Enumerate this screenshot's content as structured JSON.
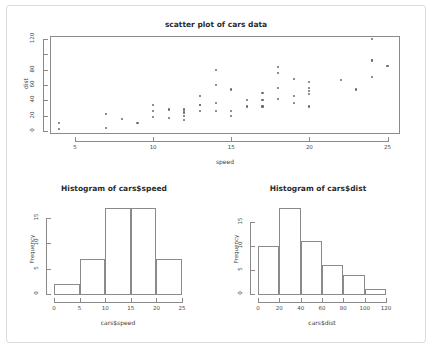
{
  "figure": {
    "background_color": "#ffffff",
    "frame_color": "#dcdcdc",
    "axis_color": "#8a8a8a",
    "point_color": "#6a6a6a"
  },
  "chart_data": [
    {
      "type": "scatter",
      "title": "scatter plot of cars data",
      "xlabel": "speed",
      "ylabel": "dist",
      "xlim": [
        3.4,
        25.8
      ],
      "ylim": [
        -4,
        124
      ],
      "xticks": [
        5,
        10,
        15,
        20,
        25
      ],
      "yticks": [
        0,
        20,
        40,
        60,
        80,
        100,
        120
      ],
      "ytick_labels": [
        "0",
        "20",
        "40",
        "60",
        "80",
        "",
        "120"
      ],
      "grid": false,
      "legend": "none",
      "x": [
        4,
        4,
        7,
        7,
        8,
        9,
        10,
        10,
        10,
        11,
        11,
        12,
        12,
        12,
        12,
        13,
        13,
        13,
        13,
        14,
        14,
        14,
        14,
        15,
        15,
        15,
        16,
        16,
        17,
        17,
        17,
        18,
        18,
        18,
        18,
        19,
        19,
        19,
        20,
        20,
        20,
        20,
        20,
        22,
        23,
        24,
        24,
        24,
        24,
        25
      ],
      "y": [
        2,
        10,
        4,
        22,
        16,
        10,
        18,
        26,
        34,
        17,
        28,
        14,
        20,
        24,
        28,
        26,
        34,
        34,
        46,
        26,
        36,
        60,
        80,
        20,
        26,
        54,
        32,
        40,
        32,
        40,
        50,
        42,
        56,
        76,
        84,
        36,
        46,
        68,
        32,
        48,
        52,
        56,
        64,
        66,
        54,
        70,
        92,
        93,
        120,
        85
      ]
    },
    {
      "type": "bar",
      "title": "Histogram of cars$speed",
      "xlabel": "cars$speed",
      "ylabel": "Frequency",
      "xlim": [
        0,
        25
      ],
      "ylim": [
        0,
        17
      ],
      "xticks": [
        0,
        5,
        10,
        15,
        20,
        25
      ],
      "yticks": [
        0,
        5,
        10,
        15
      ],
      "grid": false,
      "legend": "none",
      "bin_edges": [
        0,
        5,
        10,
        15,
        20,
        25
      ],
      "categories": [
        "0-5",
        "5-10",
        "10-15",
        "15-20",
        "20-25"
      ],
      "values": [
        2,
        7,
        17,
        17,
        7
      ]
    },
    {
      "type": "bar",
      "title": "Histogram of cars$dist",
      "xlabel": "cars$dist",
      "ylabel": "Frequency",
      "xlim": [
        0,
        120
      ],
      "ylim": [
        0,
        18
      ],
      "xticks": [
        0,
        20,
        40,
        60,
        80,
        100,
        120
      ],
      "yticks": [
        0,
        5,
        10,
        15
      ],
      "grid": false,
      "legend": "none",
      "bin_edges": [
        0,
        20,
        40,
        60,
        80,
        100,
        120
      ],
      "categories": [
        "0-20",
        "20-40",
        "40-60",
        "60-80",
        "80-100",
        "100-120"
      ],
      "values": [
        10,
        18,
        11,
        6,
        4,
        1
      ]
    }
  ]
}
